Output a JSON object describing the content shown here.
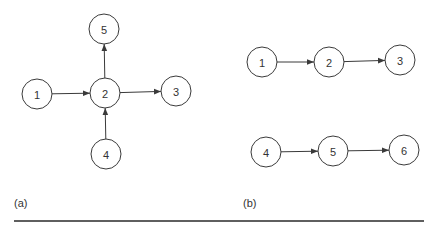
{
  "figure": {
    "colors": {
      "stroke": "#3a3a3a",
      "text": "#333333",
      "background": "#ffffff",
      "rule": "#2a2a2a"
    },
    "node_radius": 15,
    "panels": [
      {
        "id": "a",
        "label": "(a)",
        "label_pos": [
          14,
          207
        ],
        "nodes": [
          {
            "id": "5",
            "label": "5",
            "x": 104,
            "y": 29
          },
          {
            "id": "1",
            "label": "1",
            "x": 37,
            "y": 94
          },
          {
            "id": "2",
            "label": "2",
            "x": 105,
            "y": 93
          },
          {
            "id": "3",
            "label": "3",
            "x": 176,
            "y": 91
          },
          {
            "id": "4",
            "label": "4",
            "x": 106,
            "y": 154
          }
        ],
        "edges": [
          {
            "from": "1",
            "to": "2"
          },
          {
            "from": "2",
            "to": "3"
          },
          {
            "from": "2",
            "to": "5"
          },
          {
            "from": "4",
            "to": "2"
          }
        ]
      },
      {
        "id": "b",
        "label": "(b)",
        "label_pos": [
          243,
          207
        ],
        "nodes": [
          {
            "id": "1",
            "label": "1",
            "x": 262,
            "y": 62
          },
          {
            "id": "2",
            "label": "2",
            "x": 329,
            "y": 62
          },
          {
            "id": "3",
            "label": "3",
            "x": 400,
            "y": 60
          },
          {
            "id": "4",
            "label": "4",
            "x": 266,
            "y": 152
          },
          {
            "id": "5",
            "label": "5",
            "x": 333,
            "y": 151
          },
          {
            "id": "6",
            "label": "6",
            "x": 404,
            "y": 150
          }
        ],
        "edges": [
          {
            "from": "1",
            "to": "2"
          },
          {
            "from": "2",
            "to": "3"
          },
          {
            "from": "4",
            "to": "5"
          },
          {
            "from": "5",
            "to": "6"
          }
        ]
      }
    ],
    "rule": {
      "x1": 14,
      "x2": 424,
      "y": 221
    }
  }
}
